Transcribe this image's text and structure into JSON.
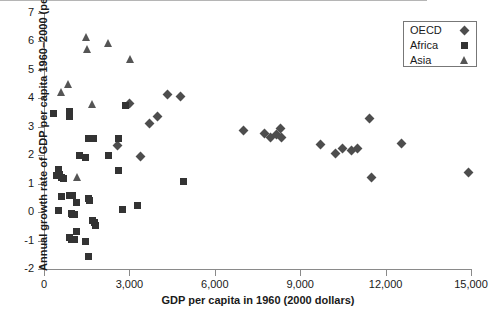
{
  "chart_data": {
    "type": "scatter",
    "title": "",
    "xlabel": "GDP per capita in 1960 (2000 dollars)",
    "ylabel": "Annual growth rate of GDP per capita 1960–2000 (percent)",
    "xlim": [
      0,
      15000
    ],
    "ylim": [
      -2,
      7
    ],
    "xticks": [
      0,
      3000,
      6000,
      9000,
      12000,
      15000
    ],
    "xticklabels": [
      "0",
      "3,000",
      "6,000",
      "9,000",
      "12,000",
      "15,000"
    ],
    "yticks": [
      -2,
      -1,
      0,
      1,
      2,
      3,
      4,
      5,
      6,
      7
    ],
    "yticklabels": [
      "-2",
      "-1",
      "0",
      "1",
      "2",
      "3",
      "4",
      "5",
      "6",
      "7"
    ],
    "grid": false,
    "zero_reference_line": true,
    "legend_position": "top-right",
    "series": [
      {
        "name": "OECD",
        "marker": "diamond",
        "color": "#4d4d4d",
        "points": [
          [
            2570,
            2.33
          ],
          [
            2990,
            3.82
          ],
          [
            4330,
            4.12
          ],
          [
            4790,
            4.05
          ],
          [
            4000,
            3.35
          ],
          [
            3700,
            3.1
          ],
          [
            3400,
            1.95
          ],
          [
            7000,
            2.88
          ],
          [
            7750,
            2.77
          ],
          [
            7950,
            2.62
          ],
          [
            8150,
            2.72
          ],
          [
            8300,
            2.95
          ],
          [
            8350,
            2.63
          ],
          [
            9700,
            2.37
          ],
          [
            10250,
            2.06
          ],
          [
            10500,
            2.25
          ],
          [
            10800,
            2.15
          ],
          [
            11000,
            2.22
          ],
          [
            11450,
            3.3
          ],
          [
            11500,
            1.22
          ],
          [
            12550,
            2.4
          ],
          [
            14900,
            1.38
          ]
        ]
      },
      {
        "name": "Africa",
        "marker": "square",
        "color": "#333333",
        "points": [
          [
            330,
            3.47
          ],
          [
            900,
            3.52
          ],
          [
            900,
            3.35
          ],
          [
            1550,
            2.6
          ],
          [
            1750,
            2.6
          ],
          [
            2600,
            2.58
          ],
          [
            2850,
            3.75
          ],
          [
            2250,
            1.99
          ],
          [
            1250,
            1.98
          ],
          [
            1450,
            1.93
          ],
          [
            4900,
            1.07
          ],
          [
            2600,
            1.47
          ],
          [
            520,
            1.5
          ],
          [
            560,
            1.33
          ],
          [
            620,
            1.22
          ],
          [
            680,
            1.17
          ],
          [
            440,
            1.28
          ],
          [
            600,
            0.56
          ],
          [
            900,
            0.58
          ],
          [
            1000,
            0.6
          ],
          [
            1150,
            0.33
          ],
          [
            1550,
            0.47
          ],
          [
            1600,
            0.41
          ],
          [
            2750,
            0.08
          ],
          [
            3280,
            0.24
          ],
          [
            500,
            0.06
          ],
          [
            950,
            -0.05
          ],
          [
            1000,
            -0.08
          ],
          [
            1060,
            -0.1
          ],
          [
            1700,
            -0.3
          ],
          [
            1760,
            -0.38
          ],
          [
            1800,
            -0.48
          ],
          [
            1150,
            -0.67
          ],
          [
            900,
            -0.88
          ],
          [
            950,
            -0.96
          ],
          [
            1080,
            -0.98
          ],
          [
            1450,
            -1.03
          ],
          [
            1580,
            -1.55
          ]
        ]
      },
      {
        "name": "Asia",
        "marker": "triangle",
        "color": "#555555",
        "points": [
          [
            1500,
            6.15
          ],
          [
            2250,
            5.95
          ],
          [
            1540,
            5.75
          ],
          [
            3050,
            5.38
          ],
          [
            870,
            4.5
          ],
          [
            620,
            4.22
          ],
          [
            1700,
            3.8
          ],
          [
            1180,
            1.23
          ]
        ]
      }
    ]
  },
  "legend": {
    "entries": [
      {
        "label": "OECD",
        "marker": "diamond"
      },
      {
        "label": "Africa",
        "marker": "square"
      },
      {
        "label": "Asia",
        "marker": "triangle"
      }
    ]
  }
}
